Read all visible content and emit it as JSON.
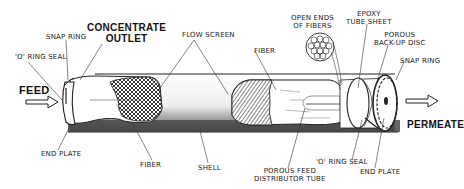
{
  "diagram": {
    "type": "hollow-fiber membrane module cutaway",
    "labels": {
      "snap_ring_left": "SNAP RING",
      "concentrate_outlet_1": "CONCENTRATE",
      "concentrate_outlet_2": "OUTLET",
      "o_ring_seal_left": "'O' RING SEAL",
      "feed": "FEED",
      "flow_screen": "FLOW SCREEN",
      "fiber_top": "FIBER",
      "open_ends_1": "OPEN ENDS",
      "open_ends_2": "OF FIBERS",
      "epoxy_1": "EPOXY",
      "epoxy_2": "TUBE SHEET",
      "porous_backup_1": "POROUS",
      "porous_backup_2": "BACK-UP DISC",
      "snap_ring_right": "SNAP RING",
      "permeate": "PERMEATE",
      "end_plate_left": "END PLATE",
      "fiber_bottom": "FIBER",
      "shell": "SHELL",
      "porous_feed_1": "POROUS FEED",
      "porous_feed_2": "DISTRIBUTOR TUBE",
      "o_ring_seal_right": "'O' RING SEAL",
      "end_plate_right": "END PLATE"
    },
    "colors": {
      "ink": "#1a1a1a",
      "shell_dark": "#3a3a3a",
      "shell_light": "#d8d8d8",
      "background": "#ffffff"
    }
  }
}
